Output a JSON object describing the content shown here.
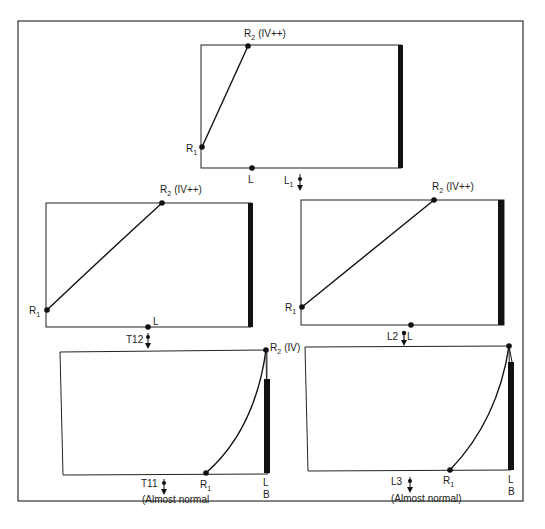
{
  "figure": {
    "panels": [
      {
        "id": "top",
        "r2_label": "R",
        "r2_sub": "2",
        "r2_grade": "(IV++)",
        "r1_label": "R",
        "r1_sub": "1",
        "l_label": "L",
        "level_label": "L",
        "level_sub": "1"
      },
      {
        "id": "middle-left",
        "r2_label": "R",
        "r2_sub": "2",
        "r2_grade": "(IV++)",
        "r1_label": "R",
        "r1_sub": "1",
        "l_label": "L",
        "level_label": "T12"
      },
      {
        "id": "middle-right",
        "r2_label": "R",
        "r2_sub": "2",
        "r2_grade": "(IV++)",
        "r1_label": "R",
        "r1_sub": "1",
        "l_label": "L",
        "level_label": "L2"
      },
      {
        "id": "bottom-left",
        "r2_label": "R",
        "r2_sub": "2",
        "r2_grade": "(IV)",
        "r1_label": "R",
        "r1_sub": "1",
        "l_label": "L",
        "b_label": "B",
        "level_label": "T11",
        "note": "(Almost normal"
      },
      {
        "id": "bottom-right",
        "r1_label": "R",
        "r1_sub": "1",
        "l_label": "L",
        "b_label": "B",
        "level_label": "L3",
        "note": "(Almost normal)"
      }
    ]
  }
}
